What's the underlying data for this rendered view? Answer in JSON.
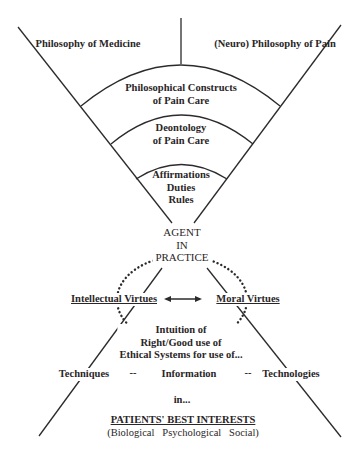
{
  "diagram": {
    "top_left": "Philosophy of Medicine",
    "top_right": "(Neuro) Philosophy of Pain",
    "band1": [
      "Philosophical Constructs",
      "of Pain Care"
    ],
    "band2": [
      "Deontology",
      "of Pain Care"
    ],
    "band3": [
      "Affirmations",
      "Duties",
      "Rules"
    ],
    "agent": [
      "AGENT",
      "IN",
      "PRACTICE"
    ],
    "left_virtue": "Intellectual Virtues",
    "right_virtue": "Moral Virtues",
    "intuition": [
      "Intuition of",
      "Right/Good use of",
      "Ethical Systems for use of..."
    ],
    "bottom_row": {
      "techniques": "Techniques",
      "sep1": "--",
      "information": "Information",
      "sep2": "--",
      "technologies": "Technologies"
    },
    "in": "in...",
    "interests_title": "PATIENTS' BEST INTERESTS",
    "interests_sub": "(Biological   Psychological   Social)"
  },
  "colors": {
    "line": "#2b2b2b",
    "text": "#2a2627",
    "background": "#ffffff"
  }
}
